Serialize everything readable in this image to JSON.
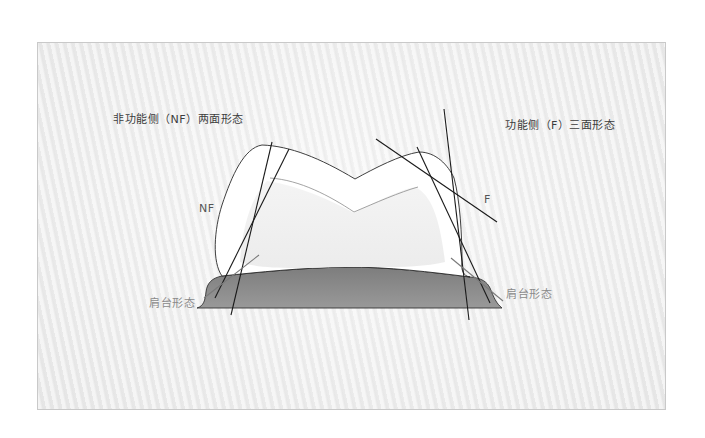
{
  "diagram": {
    "labels": {
      "nf_title": "非功能侧（NF）两面形态",
      "f_title": "功能侧（F）三面形态",
      "nf_side": "NF",
      "f_side": "F",
      "shoulder_left": "肩台形态",
      "shoulder_right": "肩台形态"
    },
    "colors": {
      "panel_background": "#ececec",
      "panel_border": "#c9c9c9",
      "crown_fill": "#ffffff",
      "crown_outline": "#2a2a2a",
      "inner_outline": "#8c8c8c",
      "gingiva_fill": "#8a8a8a",
      "gingiva_outline": "#333333",
      "reference_line": "#1a1a1a",
      "shoulder_line": "#7a7a7a",
      "title_text": "#3c3c3c",
      "shoulder_text": "#8a8a8a"
    },
    "components": [
      "crown-outline",
      "inner-preparation-outline",
      "gingiva-base",
      "nf-reduction-lines",
      "f-reduction-lines",
      "shoulder-indicator-lines"
    ]
  }
}
